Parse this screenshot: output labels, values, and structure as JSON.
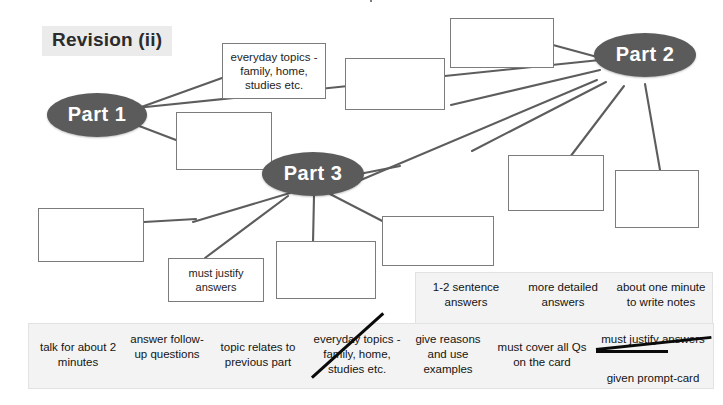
{
  "diagram": {
    "title": "Revision (ii)",
    "nodes": [
      {
        "id": "part1",
        "label": "Part 1"
      },
      {
        "id": "part2",
        "label": "Part 2"
      },
      {
        "id": "part3",
        "label": "Part 3"
      }
    ],
    "text_boxes": [
      {
        "id": "everyday-topics",
        "text": "everyday topics - family, home, studies etc."
      },
      {
        "id": "must-justify",
        "text": "must justify answers"
      }
    ],
    "blank_boxes_count": 11
  },
  "summary_top": {
    "items": [
      {
        "text": "1-2 sentence answers",
        "struck": false
      },
      {
        "text": "more detailed answers",
        "struck": false
      },
      {
        "text": "about one minute to write notes",
        "struck": false
      }
    ]
  },
  "summary_bottom": {
    "items": [
      {
        "text": "talk for about 2 minutes",
        "struck": false
      },
      {
        "text": "answer follow-up questions",
        "struck": false
      },
      {
        "text": "topic relates to previous part",
        "struck": false
      },
      {
        "text": "everyday topics - family, home, studies etc.",
        "struck": true
      },
      {
        "text": "give reasons and use examples",
        "struck": false
      },
      {
        "text": "must cover all Qs on the card",
        "struck": false
      },
      {
        "text": "must justify answers",
        "struck": true
      },
      {
        "text": "given prompt-card",
        "struck": false
      }
    ]
  },
  "colors": {
    "node_fill": "#5b5b5b",
    "node_text": "#ffffff",
    "panel_fill": "#f3f3f3",
    "box_border": "#7c7c7c",
    "title_bg": "#ebebeb",
    "link_stroke": "#5d5d5d"
  }
}
